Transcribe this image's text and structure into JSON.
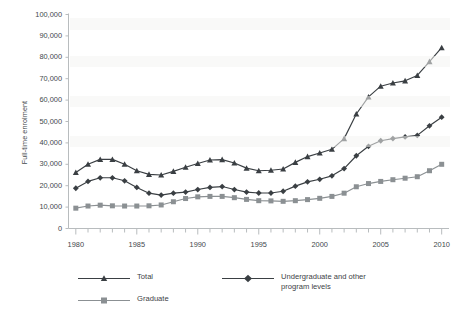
{
  "chart_data": {
    "type": "line",
    "title": "",
    "xlabel": "",
    "ylabel": "Full-time enrolment",
    "xlim": [
      1979.4,
      2010.6
    ],
    "ylim": [
      0,
      100000
    ],
    "grid": false,
    "legend_position": "bottom",
    "x": [
      1980,
      1981,
      1982,
      1983,
      1984,
      1985,
      1986,
      1987,
      1988,
      1989,
      1990,
      1991,
      1992,
      1993,
      1994,
      1995,
      1996,
      1997,
      1998,
      1999,
      2000,
      2001,
      2002,
      2003,
      2004,
      2005,
      2006,
      2007,
      2008,
      2009,
      2010
    ],
    "x_tick_labels": [
      "1980",
      "1985",
      "1990",
      "1995",
      "2000",
      "2005",
      "2010"
    ],
    "x_tick_values": [
      1980,
      1985,
      1990,
      1995,
      2000,
      2005,
      2010
    ],
    "y_tick_labels": [
      "0",
      "10,000",
      "20,000",
      "30,000",
      "40,000",
      "50,000",
      "60,000",
      "70,000",
      "80,000",
      "90,000",
      "100,000"
    ],
    "y_tick_values": [
      0,
      10000,
      20000,
      30000,
      40000,
      50000,
      60000,
      70000,
      80000,
      90000,
      100000
    ],
    "series": [
      {
        "name": "Total",
        "marker": "triangle",
        "color": "#3a3f43",
        "values": [
          26200,
          30000,
          32300,
          32300,
          30000,
          27000,
          25300,
          25000,
          26700,
          28600,
          30400,
          32000,
          32200,
          30600,
          28200,
          27000,
          27200,
          27800,
          30900,
          33600,
          35300,
          37000,
          42000,
          53500,
          61500,
          66500,
          68000,
          69000,
          71500,
          78000,
          84500
        ]
      },
      {
        "name": "Undergraduate and other\nprogram levels",
        "marker": "diamond",
        "color": "#3a3f43",
        "values": [
          18800,
          22000,
          23700,
          23700,
          22300,
          19200,
          16500,
          15600,
          16500,
          17000,
          18200,
          19200,
          19600,
          18200,
          17000,
          16600,
          16600,
          17400,
          19800,
          21800,
          23000,
          24600,
          28000,
          34000,
          38400,
          41000,
          42000,
          42800,
          43500,
          48000,
          52000
        ]
      },
      {
        "name": "Graduate",
        "marker": "square",
        "color": "#8b9093",
        "values": [
          9500,
          10500,
          10900,
          10600,
          10500,
          10500,
          10600,
          11000,
          12500,
          14000,
          14800,
          15000,
          15000,
          14400,
          13600,
          13000,
          12900,
          12700,
          13000,
          13500,
          14100,
          15000,
          16500,
          19500,
          21000,
          22000,
          22800,
          23500,
          24200,
          27000,
          30000
        ]
      }
    ]
  },
  "legend": {
    "items": [
      {
        "label": "Total",
        "marker": "triangle",
        "color": "#3a3f43"
      },
      {
        "label": "Graduate",
        "marker": "square",
        "color": "#8b9093"
      },
      {
        "label": "Undergraduate and other\nprogram levels",
        "marker": "diamond",
        "color": "#3a3f43"
      }
    ]
  },
  "axes": {
    "y_title": "Full-time enrolment"
  },
  "colors": {
    "axis": "#b8bcbe",
    "text": "#44494d",
    "series_dark": "#3a3f43",
    "series_gray": "#8b9093",
    "background": "#ffffff"
  }
}
